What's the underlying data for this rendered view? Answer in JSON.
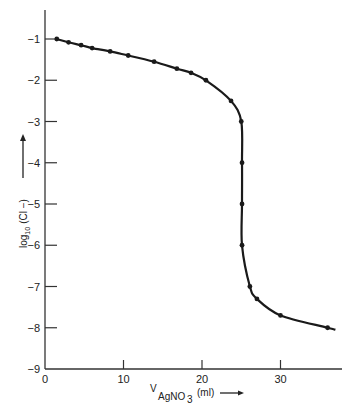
{
  "chart_data": {
    "type": "line",
    "title": "",
    "xlabel": "V_AgNO3 (ml)",
    "xlabel_main": "V",
    "xlabel_sub": "AgNO",
    "xlabel_sub2": "3",
    "xlabel_unit": "(ml)",
    "ylabel": "log10 (Cl−)",
    "ylabel_main": "log",
    "ylabel_sub": "10",
    "ylabel_rest": "(Cl −)",
    "xlim": [
      0,
      37
    ],
    "ylim": [
      -9,
      -0.3
    ],
    "x_ticks": [
      0,
      10,
      20,
      30
    ],
    "y_ticks": [
      -1,
      -2,
      -3,
      -4,
      -5,
      -6,
      -7,
      -8,
      -9
    ],
    "x_tick_labels": [
      "0",
      "10",
      "20",
      "30"
    ],
    "y_tick_labels": [
      "−1",
      "−2",
      "−3",
      "−4",
      "−5",
      "−6",
      "−7",
      "−8",
      "−9"
    ],
    "grid": false,
    "legend": null,
    "series": [
      {
        "name": "titration curve",
        "x": [
          1.5,
          3.0,
          4.6,
          6.0,
          8.3,
          10.6,
          13.9,
          16.8,
          18.6,
          20.5,
          23.7,
          25.0,
          25.1,
          25.1,
          25.1,
          26.1,
          27.0,
          30.0,
          36.0
        ],
        "values": [
          -1.0,
          -1.08,
          -1.15,
          -1.22,
          -1.3,
          -1.4,
          -1.55,
          -1.72,
          -1.82,
          -2.0,
          -2.5,
          -3.0,
          -4.0,
          -5.0,
          -6.0,
          -7.0,
          -7.3,
          -7.7,
          -8.0
        ]
      }
    ],
    "line_end": [
      37.0,
      -8.05
    ],
    "color": "#1a1a1a"
  }
}
